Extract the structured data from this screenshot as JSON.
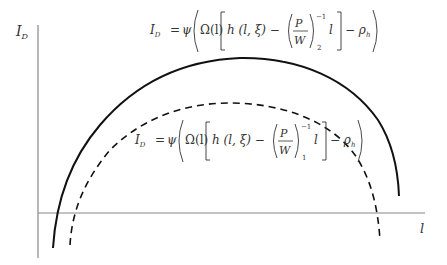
{
  "diagram": {
    "type": "curve-plot",
    "y_axis_label": "I",
    "y_axis_label_sub": "D",
    "x_axis_label": "l",
    "curves": [
      {
        "name": "curve-2",
        "style": "solid",
        "equation": {
          "lhs": "I",
          "lhs_sub": "D",
          "eq": "=",
          "psi": "ψ",
          "omega": "Ω(l)",
          "h": "h (l, ξ) −",
          "frac_num": "P",
          "frac_den": "W",
          "exp": "−1",
          "sub": "2",
          "l": "l",
          "minus_rho": "− ρ",
          "rho_sub": "h"
        }
      },
      {
        "name": "curve-1",
        "style": "dashed",
        "equation": {
          "lhs": "I",
          "lhs_sub": "D",
          "eq": "=",
          "psi": "ψ",
          "omega": "Ω(l)",
          "h": "h (l, ξ) −",
          "frac_num": "P",
          "frac_den": "W",
          "exp": "−1",
          "sub": "1",
          "l": "l",
          "minus_rho": "− ρ",
          "rho_sub": "h"
        }
      }
    ]
  }
}
